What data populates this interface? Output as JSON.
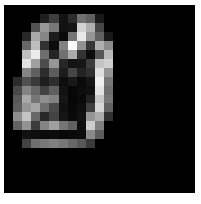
{
  "figure": {
    "kind": "raster-image-plot",
    "canvas_background": "#000000",
    "page_background": "#ffffff",
    "colormap": "gray"
  },
  "chart_data": {
    "type": "heatmap",
    "title": "",
    "subtitle": "",
    "xlabel": "",
    "ylabel": "",
    "grid": false,
    "legend": "none",
    "colormap": "gray",
    "vmin": 0,
    "vmax": 255,
    "rows": 21,
    "cols": 21,
    "xlim": [
      0,
      21
    ],
    "ylim": [
      21,
      0
    ],
    "xticklabels": [],
    "yticklabels": [],
    "annotations": [],
    "values": [
      [
        0,
        0,
        0,
        0,
        0,
        0,
        0,
        0,
        0,
        0,
        0,
        0,
        0,
        0,
        0,
        0,
        0,
        0,
        0,
        0,
        0
      ],
      [
        0,
        0,
        0,
        0,
        30,
        62,
        18,
        44,
        112,
        96,
        24,
        0,
        0,
        0,
        0,
        0,
        0,
        0,
        0,
        0,
        0
      ],
      [
        0,
        0,
        0,
        82,
        150,
        120,
        18,
        22,
        210,
        176,
        70,
        0,
        0,
        0,
        0,
        0,
        0,
        0,
        0,
        0,
        0
      ],
      [
        0,
        0,
        40,
        168,
        134,
        28,
        10,
        118,
        232,
        150,
        96,
        24,
        0,
        0,
        0,
        0,
        0,
        0,
        0,
        0,
        0
      ],
      [
        0,
        0,
        104,
        190,
        50,
        12,
        130,
        250,
        146,
        54,
        176,
        140,
        0,
        0,
        0,
        0,
        0,
        0,
        0,
        0,
        0
      ],
      [
        0,
        0,
        190,
        236,
        110,
        36,
        112,
        170,
        52,
        12,
        86,
        186,
        0,
        0,
        0,
        0,
        0,
        0,
        0,
        0,
        0
      ],
      [
        0,
        0,
        226,
        160,
        76,
        150,
        38,
        20,
        22,
        60,
        196,
        208,
        0,
        0,
        0,
        0,
        0,
        0,
        0,
        0,
        0
      ],
      [
        0,
        0,
        132,
        96,
        44,
        92,
        28,
        70,
        34,
        48,
        224,
        150,
        0,
        0,
        0,
        0,
        0,
        0,
        0,
        0,
        0
      ],
      [
        0,
        44,
        80,
        58,
        30,
        46,
        14,
        24,
        10,
        22,
        240,
        120,
        0,
        0,
        0,
        0,
        0,
        0,
        0,
        0,
        0
      ],
      [
        0,
        72,
        132,
        104,
        66,
        96,
        18,
        8,
        12,
        16,
        228,
        110,
        0,
        0,
        0,
        0,
        0,
        0,
        0,
        0,
        0
      ],
      [
        0,
        88,
        168,
        118,
        142,
        130,
        22,
        6,
        10,
        34,
        200,
        118,
        0,
        0,
        0,
        0,
        0,
        0,
        0,
        0,
        0
      ],
      [
        0,
        94,
        150,
        166,
        110,
        74,
        16,
        8,
        14,
        62,
        214,
        96,
        0,
        0,
        0,
        0,
        0,
        0,
        0,
        0,
        0
      ],
      [
        0,
        142,
        196,
        104,
        40,
        66,
        20,
        10,
        18,
        150,
        172,
        48,
        0,
        0,
        0,
        0,
        0,
        0,
        0,
        0,
        0
      ],
      [
        0,
        98,
        146,
        60,
        132,
        160,
        118,
        96,
        14,
        204,
        126,
        0,
        0,
        0,
        0,
        0,
        0,
        0,
        0,
        0,
        0
      ],
      [
        0,
        0,
        18,
        14,
        10,
        12,
        8,
        10,
        12,
        138,
        92,
        0,
        0,
        0,
        0,
        0,
        0,
        0,
        0,
        0,
        0
      ],
      [
        0,
        0,
        66,
        112,
        120,
        128,
        118,
        104,
        88,
        58,
        0,
        0,
        0,
        0,
        0,
        0,
        0,
        0,
        0,
        0,
        0
      ],
      [
        0,
        0,
        0,
        0,
        0,
        0,
        0,
        0,
        0,
        0,
        0,
        0,
        0,
        0,
        0,
        0,
        0,
        0,
        0,
        0,
        0
      ],
      [
        0,
        0,
        0,
        0,
        0,
        0,
        0,
        0,
        0,
        0,
        0,
        0,
        0,
        0,
        0,
        0,
        0,
        0,
        0,
        0,
        0
      ],
      [
        0,
        0,
        0,
        0,
        0,
        0,
        0,
        0,
        0,
        0,
        0,
        0,
        0,
        0,
        0,
        0,
        0,
        0,
        0,
        0,
        0
      ],
      [
        0,
        0,
        0,
        0,
        0,
        0,
        0,
        0,
        0,
        0,
        0,
        0,
        0,
        0,
        0,
        0,
        0,
        0,
        0,
        0,
        0
      ],
      [
        0,
        0,
        0,
        0,
        0,
        0,
        0,
        0,
        0,
        0,
        0,
        0,
        0,
        0,
        0,
        0,
        0,
        0,
        0,
        0,
        0
      ]
    ]
  }
}
